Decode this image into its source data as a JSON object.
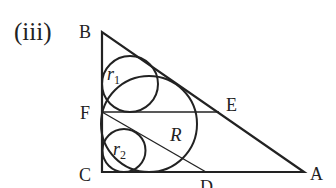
{
  "figure": {
    "part_label": "(iii)",
    "colors": {
      "stroke": "#222222",
      "background": "#ffffff"
    },
    "points": {
      "B": {
        "label": "B",
        "x": 102,
        "y": 32
      },
      "C": {
        "label": "C",
        "x": 102,
        "y": 172
      },
      "A": {
        "label": "A",
        "x": 304,
        "y": 172
      },
      "F": {
        "label": "F",
        "x": 102,
        "y": 112
      },
      "E": {
        "label": "E",
        "x": 219,
        "y": 112
      },
      "D": {
        "label": "D",
        "x": 206,
        "y": 172
      }
    },
    "segments": [
      {
        "from": "B",
        "to": "C"
      },
      {
        "from": "C",
        "to": "A"
      },
      {
        "from": "A",
        "to": "B"
      },
      {
        "from": "F",
        "to": "E"
      },
      {
        "from": "F",
        "to": "D"
      }
    ],
    "circles": [
      {
        "name": "r1",
        "label": "r",
        "subscript": "1",
        "cx": 130,
        "cy": 84,
        "r": 28
      },
      {
        "name": "R",
        "label": "R",
        "cx": 149,
        "cy": 124,
        "r": 48
      },
      {
        "name": "r2",
        "label": "r",
        "subscript": "2",
        "cx": 124,
        "cy": 150.5,
        "r": 21.5
      }
    ]
  }
}
